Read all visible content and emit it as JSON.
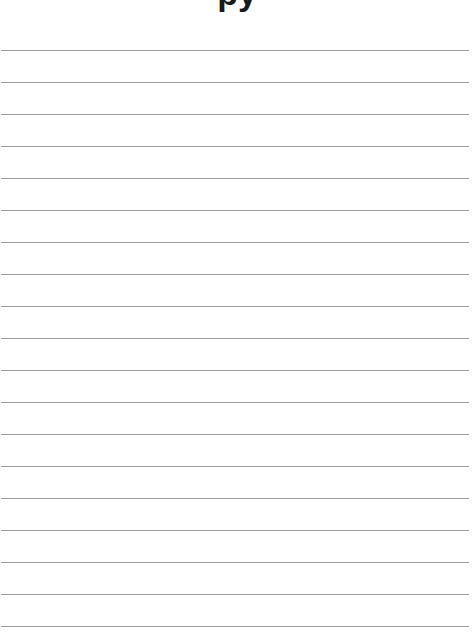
{
  "page": {
    "title_visible_fragment": "py",
    "line_count": 19,
    "line_start_y": 50,
    "line_spacing": 32,
    "line_color": "#9c9c9c",
    "background": "#ffffff"
  }
}
